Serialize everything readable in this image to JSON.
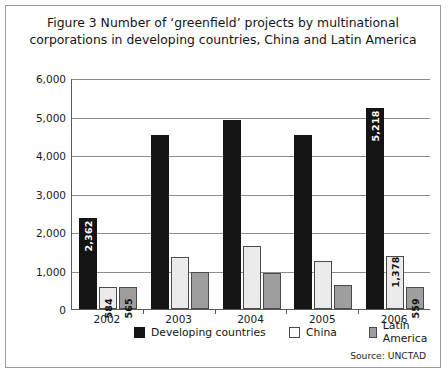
{
  "figure": {
    "title": "Figure 3 Number of ‘greenfield’ projects by multinational corporations in developing countries, China and Latin America",
    "source": "Source: UNCTAD"
  },
  "legend": {
    "items": [
      {
        "label": "Developing countries",
        "color": "#141414",
        "key": "developing"
      },
      {
        "label": "China",
        "color": "#fbfbfb",
        "key": "china"
      },
      {
        "label": "Latin America",
        "color": "#9e9e9e",
        "key": "latin"
      }
    ]
  },
  "axis": {
    "y_ticks": [
      "6,000",
      "5,000",
      "4,000",
      "3,000",
      "2,000",
      "1,000",
      "0"
    ],
    "x_ticks": [
      "2002",
      "2003",
      "2004",
      "2005",
      "2006"
    ]
  },
  "chart_data": {
    "type": "bar",
    "title": "Figure 3 Number of ‘greenfield’ projects by multinational corporations in developing countries, China and Latin America",
    "xlabel": "",
    "ylabel": "",
    "ylim": [
      0,
      6000
    ],
    "ytick_values": [
      0,
      1000,
      2000,
      3000,
      4000,
      5000,
      6000
    ],
    "grid": true,
    "legend_position": "bottom",
    "categories": [
      "2002",
      "2003",
      "2004",
      "2005",
      "2006"
    ],
    "series": [
      {
        "name": "Developing countries",
        "color": "#141414",
        "values": [
          2362,
          4510,
          4900,
          4510,
          5218
        ],
        "data_labels": [
          "2,362",
          "",
          "",
          "",
          "5,218"
        ]
      },
      {
        "name": "China",
        "color": "#fbfbfb",
        "values": [
          584,
          1340,
          1640,
          1240,
          1378
        ],
        "data_labels": [
          "584",
          "",
          "",
          "",
          "1,378"
        ]
      },
      {
        "name": "Latin America",
        "color": "#9e9e9e",
        "values": [
          565,
          950,
          930,
          620,
          559
        ],
        "data_labels": [
          "565",
          "",
          "",
          "",
          "559"
        ]
      }
    ],
    "source": "Source: UNCTAD"
  }
}
